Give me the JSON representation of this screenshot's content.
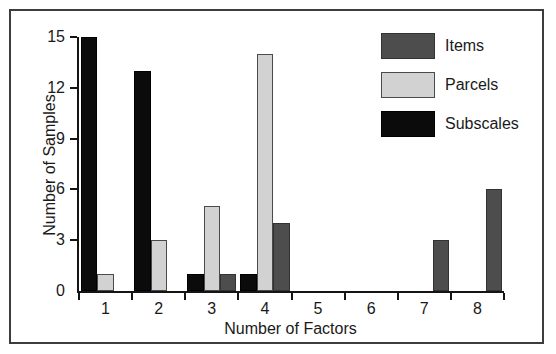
{
  "figure": {
    "background": "#ffffff",
    "frame_border_color": "#3d3d3d"
  },
  "chart_data": {
    "type": "bar",
    "title": "",
    "xlabel": "Number of Factors",
    "ylabel": "Number of Samples",
    "categories": [
      "1",
      "2",
      "3",
      "4",
      "5",
      "6",
      "7",
      "8"
    ],
    "series": [
      {
        "name": "Subscales",
        "color": "#0b0b0b",
        "border": "#000000",
        "values": [
          15,
          13,
          1,
          1,
          0,
          0,
          0,
          0
        ]
      },
      {
        "name": "Parcels",
        "color": "#d2d2d2",
        "border": "#4a4a4a",
        "values": [
          1,
          3,
          5,
          14,
          0,
          0,
          0,
          0
        ]
      },
      {
        "name": "Items",
        "color": "#4d4d4d",
        "border": "#333333",
        "values": [
          0,
          0,
          1,
          4,
          0,
          0,
          3,
          6
        ]
      }
    ],
    "legend": {
      "position": "top-right",
      "entries": [
        "Items",
        "Parcels",
        "Subscales"
      ]
    },
    "y_ticks": [
      0,
      3,
      6,
      9,
      12,
      15
    ],
    "ylim": [
      0,
      15
    ],
    "grid": false,
    "axis_color": "#141414",
    "text_color": "#1a1a1a"
  }
}
